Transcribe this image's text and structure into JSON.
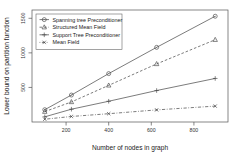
{
  "chart_data": {
    "type": "line",
    "title": "",
    "xlabel": "Number of nodes in graph",
    "ylabel": "Lower bound on partition function",
    "x": [
      100,
      225,
      400,
      625,
      900
    ],
    "xlim": [
      40,
      960
    ],
    "ylim": [
      0,
      1620
    ],
    "xticks": [
      200,
      400,
      600,
      800
    ],
    "xticklabels": [
      "200",
      "400",
      "600",
      "800"
    ],
    "yticks": [
      500,
      1000,
      1500
    ],
    "yticklabels": [
      "500",
      "1000",
      "1500"
    ],
    "grid": false,
    "legend_position": "top-left",
    "series": [
      {
        "name": "Spanning tree Preconditioner",
        "marker": "circle-dot",
        "linestyle": "solid",
        "values": [
          178,
          390,
          700,
          1080,
          1530
        ]
      },
      {
        "name": "Structured Mean Field",
        "marker": "triangle",
        "linestyle": "dashed",
        "values": [
          150,
          290,
          530,
          840,
          1190
        ]
      },
      {
        "name": "Support Tree Preconditioner",
        "marker": "plus",
        "linestyle": "solid",
        "values": [
          75,
          185,
          300,
          455,
          630
        ]
      },
      {
        "name": "Mean Field",
        "marker": "x-dot",
        "linestyle": "dotdash",
        "values": [
          40,
          80,
          120,
          175,
          230
        ]
      }
    ]
  }
}
